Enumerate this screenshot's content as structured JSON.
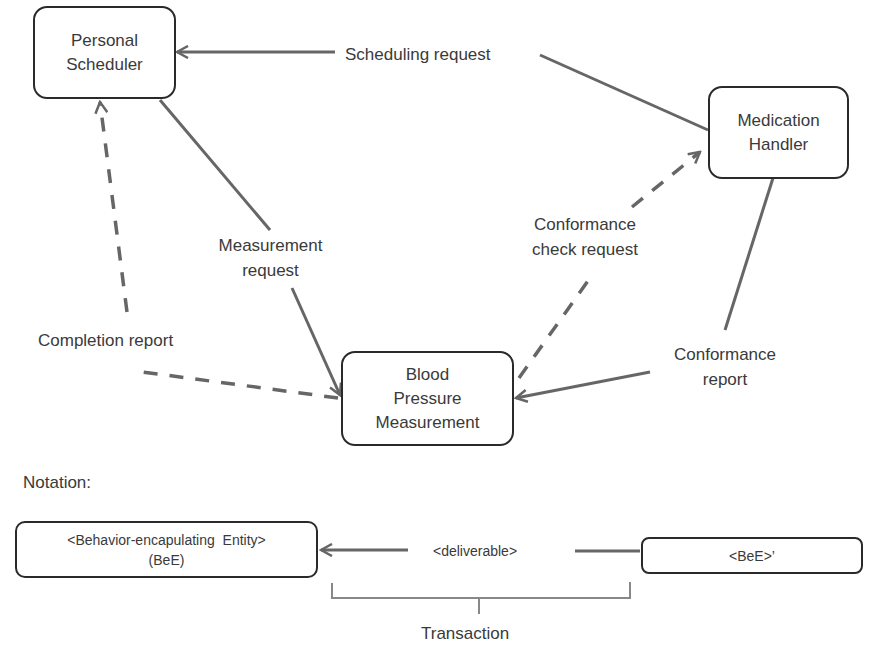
{
  "diagram": {
    "nodes": {
      "personal_scheduler": {
        "line1": "Personal",
        "line2": "Scheduler"
      },
      "medication_handler": {
        "line1": "Medication",
        "line2": "Handler"
      },
      "blood_pressure": {
        "line1": "Blood",
        "line2": "Pressure",
        "line3": "Measurement"
      }
    },
    "edges": {
      "scheduling_request": "Scheduling request",
      "measurement_request": {
        "line1": "Measurement",
        "line2": "request"
      },
      "completion_report": "Completion report",
      "conformance_check_request": {
        "line1": "Conformance",
        "line2": "check request"
      },
      "conformance_report": {
        "line1": "Conformance",
        "line2": "report"
      }
    },
    "line_color": "#666666",
    "border_color": "#2a2a2a"
  },
  "notation": {
    "title": "Notation:",
    "entity": {
      "line1": "<Behavior-encapulating  Entity>",
      "line2": "(BeE)"
    },
    "deliverable": "<deliverable>",
    "entity_prime": "<BeE>’",
    "transaction": "Transaction"
  }
}
